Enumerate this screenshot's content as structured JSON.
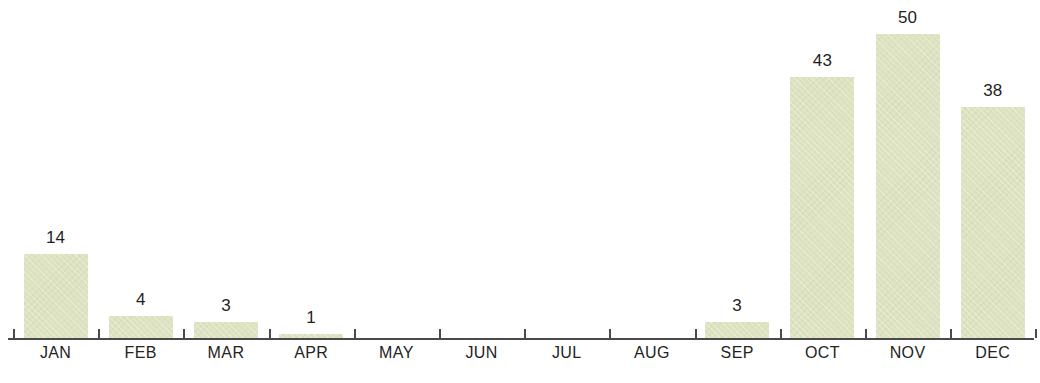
{
  "chart_data": {
    "type": "bar",
    "title": "",
    "subtitle": "",
    "xlabel": "",
    "ylabel": "",
    "categories": [
      "JAN",
      "FEB",
      "MAR",
      "APR",
      "MAY",
      "JUN",
      "JUL",
      "AUG",
      "SEP",
      "OCT",
      "NOV",
      "DEC"
    ],
    "values": [
      14,
      4,
      3,
      1,
      0,
      0,
      0,
      0,
      3,
      43,
      50,
      38
    ],
    "data_labels": [
      "14",
      "4",
      "3",
      "1",
      "",
      "",
      "",
      "",
      "3",
      "43",
      "50",
      "38"
    ],
    "ylim": [
      0,
      50
    ],
    "grid": false,
    "legend": null,
    "bar_color": "#dde3c0",
    "axis_color": "#4a4a4a",
    "label_color": "#232323",
    "background": "#ffffff"
  },
  "axis": {
    "tick_count": 13,
    "baseline_label": "x-axis-baseline"
  }
}
